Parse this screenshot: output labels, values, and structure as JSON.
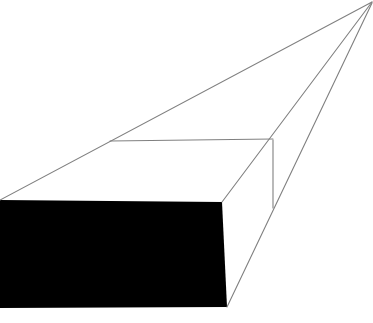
{
  "canvas": {
    "width": 373,
    "height": 323,
    "background_color": "#ffffff",
    "title": "One-point perspective rectangular box"
  },
  "style": {
    "line_color": "#808080",
    "line_width": 1.1,
    "fill_front_face": "#000000",
    "fill_top_face": "#ffffff",
    "fill_side_face": "#ffffff"
  },
  "geometry": {
    "vanishing_point": {
      "x": 372,
      "y": 2
    },
    "front_face": {
      "label": "front-face",
      "fill": "#000000",
      "points": "0,200 222,202 227,307 0,308"
    },
    "top_face": {
      "label": "top-face",
      "fill": "#ffffff",
      "points": "0,200 110,141 273,140 222,202"
    },
    "right_side_face": {
      "label": "right-side-face",
      "fill": "#ffffff",
      "points": "222,202 273,140 273,208 227,307"
    },
    "edges": [
      {
        "name": "edge-top-long-receding",
        "x1": 0,
        "y1": 200,
        "x2": 372,
        "y2": 2
      },
      {
        "name": "edge-top-near-horizontal",
        "x1": 110,
        "y1": 141,
        "x2": 273,
        "y2": 139
      },
      {
        "name": "edge-upper-right-receding",
        "x1": 222,
        "y1": 202,
        "x2": 372,
        "y2": 2
      },
      {
        "name": "edge-lower-right-receding",
        "x1": 227,
        "y1": 307,
        "x2": 372,
        "y2": 3
      },
      {
        "name": "edge-vertical-far-corner",
        "x1": 273,
        "y1": 140,
        "x2": 273,
        "y2": 208
      }
    ]
  }
}
